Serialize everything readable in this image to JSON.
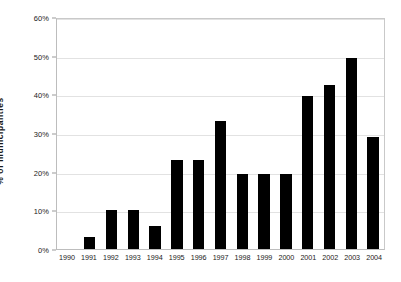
{
  "chart_data": {
    "type": "bar",
    "title": "",
    "xlabel": "",
    "ylabel": "% of municipalities",
    "ylim": [
      0,
      60
    ],
    "ytick_labels": [
      "0%",
      "10%",
      "20%",
      "30%",
      "40%",
      "50%",
      "60%"
    ],
    "ytick_values": [
      0,
      10,
      20,
      30,
      40,
      50,
      60
    ],
    "grid": true,
    "legend": "none",
    "bar_color": "#000000",
    "grid_color": "#e2e2e2",
    "axis_color": "#bdbdbd",
    "categories": [
      "1990",
      "1991",
      "1992",
      "1993",
      "1994",
      "1995",
      "1996",
      "1997",
      "1998",
      "1999",
      "2000",
      "2001",
      "2002",
      "2003",
      "2004"
    ],
    "values": [
      0,
      3,
      10,
      10,
      6,
      23,
      23,
      33,
      19.5,
      19.5,
      19.5,
      39.5,
      42.5,
      49.5,
      29
    ]
  }
}
